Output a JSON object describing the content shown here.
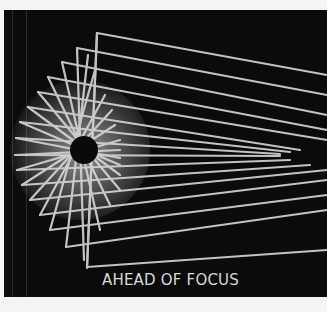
{
  "image": {
    "caption": "AHEAD OF FOCUS",
    "background_color": "#0b0b0b",
    "ray_color": "#d9d9d9",
    "description": "Light rays reflected from an arc of mirror corners converging around a dark central disc"
  }
}
